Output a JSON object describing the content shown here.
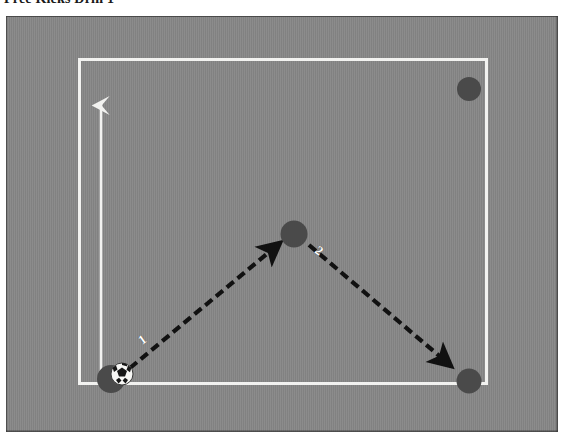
{
  "document": {
    "title": "Free Kicks Drill 1"
  },
  "diagram": {
    "name": "soccer-drill-diagram",
    "field": {
      "surface_color": "#878787",
      "boundary_color": "#f2f2f0",
      "boundary_label": "pitch-boundary"
    },
    "direction_arrow": {
      "label": "attacking-direction",
      "color": "#f2f2f0",
      "from": [
        95,
        355
      ],
      "to": [
        95,
        82
      ]
    },
    "players": [
      {
        "id": "player-start",
        "role": "kicker",
        "x": 105,
        "y": 363,
        "r": 14,
        "color": "#4a4a4a"
      },
      {
        "id": "player-mid",
        "role": "receiver",
        "x": 288,
        "y": 218,
        "r": 13,
        "color": "#4a4a4a"
      },
      {
        "id": "player-top-right",
        "role": "target",
        "x": 463,
        "y": 73,
        "r": 12,
        "color": "#4a4a4a"
      },
      {
        "id": "player-bottom-right",
        "role": "target",
        "x": 463,
        "y": 365,
        "r": 12,
        "color": "#4a4a4a"
      }
    ],
    "ball": {
      "id": "soccer-ball",
      "x": 116,
      "y": 358,
      "r": 11
    },
    "passes": [
      {
        "number": "1",
        "style": "dashed",
        "color": "#111111",
        "from": [
          124,
          352
        ],
        "to": [
          276,
          226
        ],
        "label_position": [
          141,
          324
        ]
      },
      {
        "number": "2",
        "style": "dashed",
        "color": "#111111",
        "from": [
          302,
          228
        ],
        "to": [
          447,
          352
        ],
        "label_position": [
          318,
          235
        ]
      }
    ]
  }
}
